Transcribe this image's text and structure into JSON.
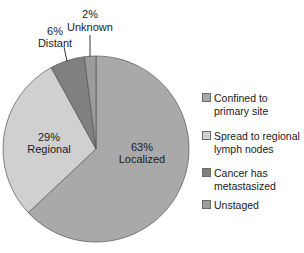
{
  "chart_data": {
    "type": "pie",
    "title": "",
    "slices": [
      {
        "label": "Localized",
        "value": 63,
        "display": "63%",
        "legend": "Confined to\nprimary site",
        "color": "#a9a9a9"
      },
      {
        "label": "Regional",
        "value": 29,
        "display": "29%",
        "legend": "Spread to regional\nlymph nodes",
        "color": "#d0d0d0"
      },
      {
        "label": "Distant",
        "value": 6,
        "display": "6%",
        "legend": "Cancer has\nmetastasized",
        "color": "#808080"
      },
      {
        "label": "Unknown",
        "value": 2,
        "display": "2%",
        "legend": "Unstaged",
        "color": "#9c9c9c"
      }
    ],
    "start_angle": "12 o'clock",
    "direction": "clockwise",
    "legend_position": "right"
  },
  "labels": {
    "localized_pct": "63%",
    "localized_name": "Localized",
    "regional_pct": "29%",
    "regional_name": "Regional",
    "distant_pct": "6%",
    "distant_name": "Distant",
    "unknown_pct": "2%",
    "unknown_name": "Unknown"
  },
  "legend": [
    {
      "text": "Confined to\nprimary site",
      "color": "#a9a9a9"
    },
    {
      "text": "Spread to regional\nlymph nodes",
      "color": "#d0d0d0"
    },
    {
      "text": "Cancer has\nmetastasized",
      "color": "#808080"
    },
    {
      "text": "Unstaged",
      "color": "#9c9c9c"
    }
  ]
}
